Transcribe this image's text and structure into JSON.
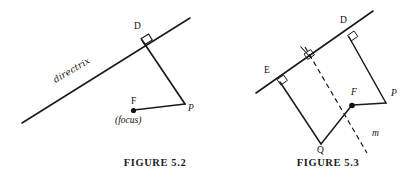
{
  "page": {
    "background": "#ffffff",
    "ink": "#1a1a1a",
    "width": 405,
    "height": 178
  },
  "figures": [
    {
      "id": "figure-5-2",
      "caption": "FIGURE 5.2",
      "caption_x": 155,
      "caption_y": 160,
      "labels": {
        "directrix": "directrix",
        "point_d": "D",
        "point_f": "F",
        "focus_note": "(focus)",
        "point_p": "P"
      },
      "geometry": {
        "directrix_line": [
          [
            22,
            123
          ],
          [
            190,
            18
          ]
        ],
        "segment_d_p": [
          [
            141,
            38
          ],
          [
            185,
            104
          ]
        ],
        "segment_p_f": [
          [
            185,
            104
          ],
          [
            133,
            110
          ]
        ],
        "right_angle_at": "D",
        "focus_dot": [
          133,
          110
        ]
      }
    },
    {
      "id": "figure-5-3",
      "caption": "FIGURE 5.3",
      "caption_x": 328,
      "caption_y": 160,
      "labels": {
        "point_e": "E",
        "point_d": "D",
        "point_p": "P",
        "point_f": "F",
        "point_q": "Q",
        "line_m": "m"
      },
      "geometry": {
        "directrix_line": [
          [
            256,
            93
          ],
          [
            372,
            12
          ]
        ],
        "segment_d_p": [
          [
            348,
            35
          ],
          [
            385,
            103
          ]
        ],
        "segment_p_f": [
          [
            385,
            103
          ],
          [
            352,
            105
          ]
        ],
        "segment_e_q": [
          [
            277,
            79
          ],
          [
            321,
            143
          ]
        ],
        "segment_q_f": [
          [
            321,
            143
          ],
          [
            352,
            105
          ]
        ],
        "dashed_line_m": [
          [
            305,
            48
          ],
          [
            366,
            152
          ]
        ],
        "focus_dot": [
          352,
          105
        ],
        "right_angles": [
          "D",
          "E",
          "dashed-directrix-intersection"
        ]
      }
    }
  ]
}
